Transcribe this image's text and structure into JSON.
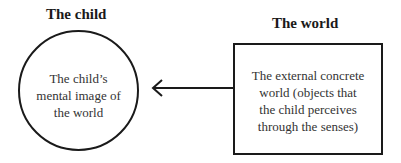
{
  "diagram": {
    "left": {
      "heading": "The child",
      "shape": "circle",
      "lines": [
        "The child’s",
        "mental image of",
        "the world"
      ]
    },
    "right": {
      "heading": "The world",
      "shape": "rectangle",
      "lines": [
        "The external concrete",
        "world (objects that",
        "the child perceives",
        "through the senses)"
      ]
    },
    "arrow": {
      "from": "right",
      "to": "left",
      "color": "#1a1a1a"
    }
  }
}
